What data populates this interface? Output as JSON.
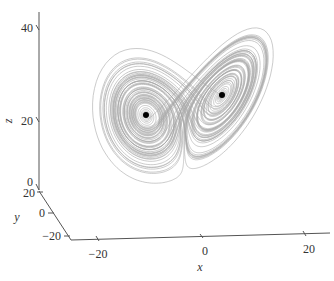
{
  "chart_data": {
    "type": "line",
    "title": "",
    "xlabel": "x",
    "ylabel": "y",
    "zlabel": "z",
    "x_ticks": [
      "−20",
      "0",
      "20"
    ],
    "y_ticks": [
      "20",
      "0",
      "−20"
    ],
    "z_ticks": [
      "0",
      "20",
      "40"
    ],
    "xlim": [
      -25,
      25
    ],
    "ylim": [
      -25,
      25
    ],
    "zlim": [
      0,
      45
    ],
    "grid": false,
    "legend": null,
    "series": [
      {
        "name": "trajectory",
        "color": "#a8a8a8",
        "style": "line"
      },
      {
        "name": "fixed-points",
        "color": "#000000",
        "style": "marker",
        "points": [
          {
            "x": -8.5,
            "y": -8.5,
            "z": 27
          },
          {
            "x": 8.5,
            "y": 8.5,
            "z": 27
          }
        ]
      }
    ]
  },
  "colors": {
    "trajectory": "#a8a8a8",
    "axis": "#555555",
    "point": "#000000"
  }
}
